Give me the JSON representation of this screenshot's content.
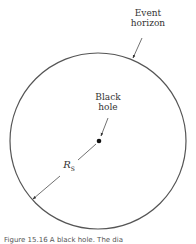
{
  "diagram": {
    "labels": {
      "event_horizon_line1": "Event",
      "event_horizon_line2": "horizon",
      "black_hole_line1": "Black",
      "black_hole_line2": "hole",
      "radius": "R",
      "radius_subscript": "S"
    },
    "caption": "Figure 15.16 A black hole. The dia"
  },
  "colors": {
    "circle": "#555555",
    "text": "#333333",
    "background": "#ffffff"
  }
}
